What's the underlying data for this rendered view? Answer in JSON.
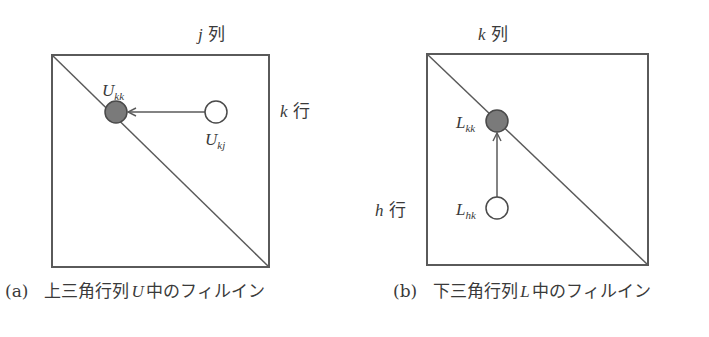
{
  "panel_a": {
    "column_label": {
      "var": "j",
      "text": "列"
    },
    "row_label": {
      "var": "k",
      "text": "行"
    },
    "filled_node": {
      "base": "U",
      "sub": "kk"
    },
    "open_node": {
      "base": "U",
      "sub": "kj"
    },
    "caption": {
      "num": "(a)",
      "pre": "上三角行列",
      "var": "U",
      "post": "中のフィルイン"
    }
  },
  "panel_b": {
    "column_label": {
      "var": "k",
      "text": "列"
    },
    "row_label": {
      "var": "h",
      "text": "行"
    },
    "filled_node": {
      "base": "L",
      "sub": "kk"
    },
    "open_node": {
      "base": "L",
      "sub": "hk"
    },
    "caption": {
      "num": "(b)",
      "pre": "下三角行列",
      "var": "L",
      "post": "中のフィルイン"
    }
  },
  "colors": {
    "line": "#5a5a5a",
    "filled_node": "#7a7a7a",
    "open_node": "#ffffff",
    "text": "#3a3a3a"
  }
}
